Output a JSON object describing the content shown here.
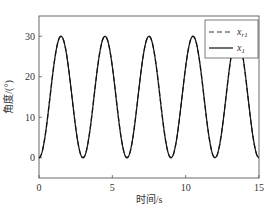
{
  "chart_data": {
    "type": "line",
    "title": "",
    "xlabel": "时间/s",
    "ylabel": "角度/(°)",
    "xlim": [
      0,
      15
    ],
    "ylim": [
      -5,
      35
    ],
    "xticks": [
      "0",
      "5",
      "10",
      "15"
    ],
    "yticks": [
      "0",
      "10",
      "20",
      "30"
    ],
    "grid": false,
    "legend_position": "upper right",
    "series": [
      {
        "name": "x_r1",
        "style": "dashed",
        "color": "#333333",
        "function": "15*(1-cos(2*pi*t/3))"
      },
      {
        "name": "x_1",
        "style": "solid",
        "color": "#111111",
        "function": "15*(1-cos(2*pi*t/3))"
      }
    ],
    "x": [
      0,
      0.75,
      1.5,
      2.25,
      3,
      3.75,
      4.5,
      5.25,
      6,
      6.75,
      7.5,
      8.25,
      9,
      9.75,
      10.5,
      11.25,
      12,
      12.75,
      13.5,
      14.25,
      15
    ],
    "values": [
      0,
      15,
      30,
      15,
      0,
      15,
      30,
      15,
      0,
      15,
      30,
      15,
      0,
      15,
      30,
      15,
      0,
      15,
      30,
      15,
      0
    ]
  },
  "legend": {
    "item1_main": "x",
    "item1_sub": "r1",
    "item2_main": "x",
    "item2_sub": "1"
  }
}
